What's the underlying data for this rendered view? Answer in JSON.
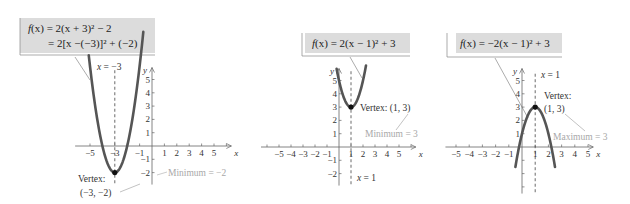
{
  "chart_data": [
    {
      "type": "line",
      "title": "f(x) = 2(x + 3)^2 - 2",
      "equation_lines": [
        "f(x) = 2(x + 3)² − 2",
        "= 2[x −(−3)]² + (−2)"
      ],
      "xlabel": "x",
      "ylabel": "y",
      "x_ticks": [
        -5,
        -3,
        -1,
        1,
        2,
        3,
        4,
        5
      ],
      "x_tick_labels": [
        "−5",
        "−3",
        "−1",
        "1",
        "2",
        "3",
        "4",
        "5"
      ],
      "y_ticks": [
        -2,
        -1,
        1,
        2,
        3,
        4,
        5
      ],
      "y_tick_labels": [
        "−2",
        "−1",
        "1",
        "2",
        "3",
        "4",
        "5"
      ],
      "vertex": [
        -3,
        -2
      ],
      "axis_of_symmetry": "x = −3",
      "vertex_label": [
        "Vertex:",
        "(−3, −2)"
      ],
      "extremum_label": "Minimum = −2",
      "a": 2,
      "h": -3,
      "k": -2,
      "xlim": [
        -5.6,
        5.8
      ],
      "ylim": [
        -2.8,
        5.8
      ]
    },
    {
      "type": "line",
      "title": "f(x) = 2(x - 1)^2 + 3",
      "equation_lines": [
        "f(x) = 2(x − 1)² + 3"
      ],
      "xlabel": "x",
      "ylabel": "y",
      "x_ticks": [
        -5,
        -4,
        -3,
        -2,
        -1,
        1,
        2,
        3,
        4,
        5
      ],
      "x_tick_labels": [
        "−5",
        "−4",
        "−3",
        "−2",
        "−1",
        "1",
        "2",
        "3",
        "4",
        "5"
      ],
      "y_ticks": [
        -2,
        -1,
        1,
        2,
        3,
        4,
        5
      ],
      "y_tick_labels": [
        "−2",
        "−1",
        "1",
        "2",
        "3",
        "4",
        "5"
      ],
      "vertex": [
        1,
        3
      ],
      "axis_of_symmetry": "x = 1",
      "vertex_label": [
        "Vertex: (1, 3)"
      ],
      "extremum_label": "Minimum = 3",
      "a": 2,
      "h": 1,
      "k": 3,
      "xlim": [
        -6,
        6
      ],
      "ylim": [
        -2.8,
        5.8
      ]
    },
    {
      "type": "line",
      "title": "f(x) = -2(x - 1)^2 + 3",
      "equation_lines": [
        "f(x) = −2(x − 1)² + 3"
      ],
      "xlabel": "x",
      "ylabel": "y",
      "x_ticks": [
        -5,
        -4,
        -3,
        -2,
        -1,
        1,
        2,
        3,
        4,
        5
      ],
      "x_tick_labels": [
        "−5",
        "−4",
        "−3",
        "−2",
        "−1",
        "1",
        "2",
        "3",
        "4",
        "5"
      ],
      "y_ticks": [
        -3,
        -2,
        -1,
        1,
        2,
        3,
        4,
        5
      ],
      "y_tick_labels": [
        "",
        "",
        "",
        "1",
        "2",
        "3",
        "4",
        "5"
      ],
      "vertex": [
        1,
        3
      ],
      "axis_of_symmetry": "x = 1",
      "vertex_label": [
        "Vertex:",
        "(1, 3)"
      ],
      "extremum_label": "Maximum = 3",
      "a": -2,
      "h": 1,
      "k": 3,
      "xlim": [
        -6,
        6
      ],
      "ylim": [
        -3.5,
        5.8
      ]
    }
  ],
  "colors": {
    "curve": "#555555",
    "axis": "#666666",
    "label_box": "#dcdcdc",
    "annotation_gray": "#a8a8a8",
    "text": "#222222"
  },
  "labels": {
    "p1": {
      "f": "f",
      "eq1_rest": "(x) = 2(x + 3)² − 2",
      "eq2": "= 2[x −(−3)]² + (−2)",
      "axis": "x = −3",
      "vertex1": "Vertex:",
      "vertex2": "(−3, −2)",
      "ext": "Minimum = −2"
    },
    "p2": {
      "f": "f",
      "eq1_rest": "(x) = 2(x − 1)² + 3",
      "axis": "x = 1",
      "vertex1": "Vertex: (1, 3)",
      "ext": "Minimum = 3"
    },
    "p3": {
      "f": "f",
      "eq1_rest": "(x) = −2(x − 1)² + 3",
      "axis": "x = 1",
      "vertex1": "Vertex:",
      "vertex2": "(1, 3)",
      "ext": "Maximum = 3"
    },
    "x": "x",
    "y": "y"
  }
}
